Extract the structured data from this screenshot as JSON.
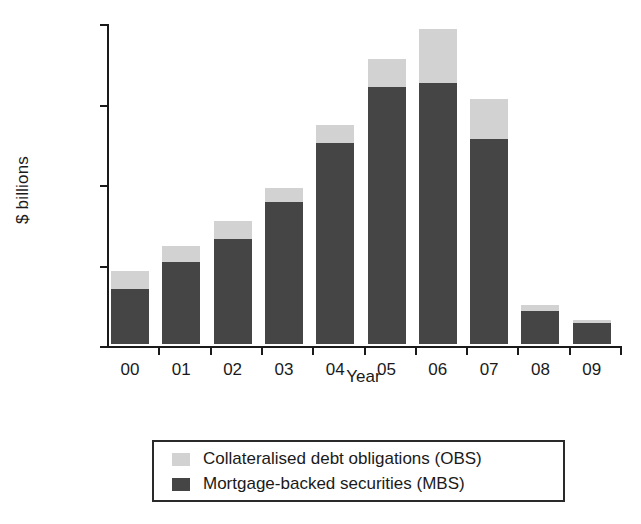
{
  "chart_data": {
    "type": "bar",
    "stacked": true,
    "title": "",
    "xlabel": "Year",
    "ylabel": "$ billions",
    "categories": [
      "00",
      "01",
      "02",
      "03",
      "04",
      "05",
      "06",
      "07",
      "08",
      "09"
    ],
    "series": [
      {
        "name": "Mortgage-backed securities (MBS)",
        "color": "#454545",
        "values": [
          341,
          509,
          652,
          882,
          1248,
          1596,
          1621,
          1273,
          205,
          130
        ]
      },
      {
        "name": "Collateralised debt obligations (OBS)",
        "color": "#d2d2d2",
        "values": [
          112,
          100,
          112,
          87,
          112,
          174,
          336,
          248,
          37,
          19
        ]
      }
    ],
    "totals": [
      453,
      609,
      764,
      969,
      1360,
      1770,
      1957,
      1521,
      242,
      149
    ],
    "ylim": [
      0,
      2000
    ],
    "yticks": [
      0,
      500,
      1000,
      1500,
      2000
    ],
    "ytick_labels": [
      "0",
      "500",
      "1000",
      "1500",
      "2000"
    ],
    "grid": false,
    "legend_position": "below-center",
    "legend_entries": [
      {
        "label": "Collateralised debt obligations (OBS)",
        "swatch": "#d2d2d2"
      },
      {
        "label": "Mortgage-backed securities (MBS)",
        "swatch": "#454545"
      }
    ]
  }
}
